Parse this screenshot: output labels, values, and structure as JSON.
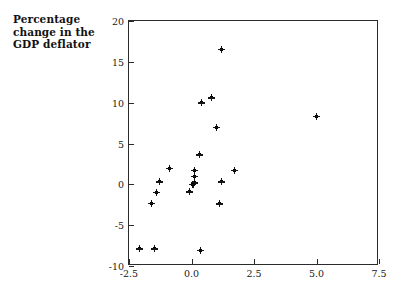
{
  "figure": {
    "y_axis_caption": "Percentage\nchange in the\nGDP deflator",
    "background_color": "#ffffff",
    "frame_color": "#2b2b2b",
    "marker_color": "#151515"
  },
  "chart_data": {
    "type": "scatter",
    "title": "",
    "subtitle": "",
    "xlabel": "",
    "ylabel": "Percentage change in the GDP deflator",
    "xlim": [
      -2.5,
      7.5
    ],
    "ylim": [
      -10,
      20
    ],
    "grid": false,
    "legend": null,
    "xticks": [
      -2.5,
      0.0,
      2.5,
      5.0,
      7.5
    ],
    "xtick_labels": [
      "-2.5",
      "0.0",
      "2.5",
      "5.0",
      "7.5"
    ],
    "yticks": [
      -10,
      -5,
      0,
      5,
      10,
      15,
      20
    ],
    "ytick_labels": [
      "-10",
      "-5",
      "0",
      "5",
      "10",
      "15",
      "20"
    ],
    "marker": "plus",
    "points": [
      {
        "x": 1.2,
        "y": 16.5
      },
      {
        "x": 0.8,
        "y": 10.6
      },
      {
        "x": 0.4,
        "y": 10.0
      },
      {
        "x": 5.0,
        "y": 8.3
      },
      {
        "x": 1.0,
        "y": 7.0
      },
      {
        "x": 0.3,
        "y": 3.6
      },
      {
        "x": -0.9,
        "y": 2.0
      },
      {
        "x": 1.7,
        "y": 1.7
      },
      {
        "x": 0.1,
        "y": 1.7
      },
      {
        "x": 0.1,
        "y": 1.0
      },
      {
        "x": -1.3,
        "y": 0.3
      },
      {
        "x": 1.2,
        "y": 0.3
      },
      {
        "x": 0.1,
        "y": 0.2
      },
      {
        "x": 0.05,
        "y": 0.0
      },
      {
        "x": -0.1,
        "y": -0.9
      },
      {
        "x": -1.4,
        "y": -1.0
      },
      {
        "x": 1.1,
        "y": -2.4
      },
      {
        "x": -1.6,
        "y": -2.3
      },
      {
        "x": -2.1,
        "y": -7.9
      },
      {
        "x": -1.5,
        "y": -7.9
      },
      {
        "x": 0.35,
        "y": -8.1
      }
    ]
  }
}
